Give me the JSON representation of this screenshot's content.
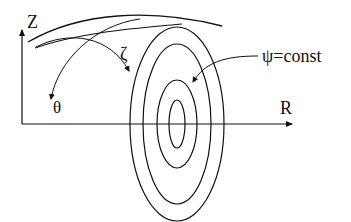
{
  "diagram": {
    "type": "tokamak flux-surface coordinate sketch",
    "axes": {
      "vertical": {
        "label": "Z"
      },
      "horizontal": {
        "label": "R"
      }
    },
    "angles": {
      "toroidal": {
        "label": "ζ"
      },
      "poloidal": {
        "label": "θ"
      }
    },
    "flux_surface_label": "ψ=const",
    "nested_ellipse_count": 4,
    "line_color": "#111111",
    "background": "#ffffff"
  }
}
